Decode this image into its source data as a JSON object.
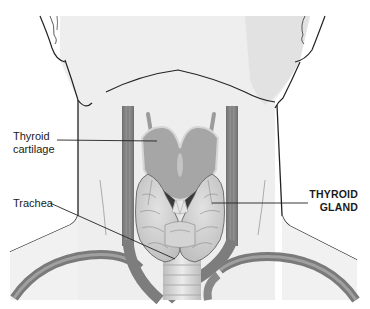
{
  "figure": {
    "labels": {
      "thyroid_cartilage": {
        "line1": "Thyroid",
        "line2": "cartilage"
      },
      "trachea": "Trachea",
      "thyroid_gland": {
        "line1": "THYROID",
        "line2": "GLAND"
      }
    },
    "colors": {
      "skin": "#eeeeee",
      "skin_shadow": "#dcdcdc",
      "outline": "#222222",
      "vessel": "#8a8a8a",
      "vessel_dark": "#6e6e6e",
      "cartilage": "#a9a9a9",
      "gland": "#cfcfcf",
      "trachea": "#d9d9d9"
    }
  }
}
